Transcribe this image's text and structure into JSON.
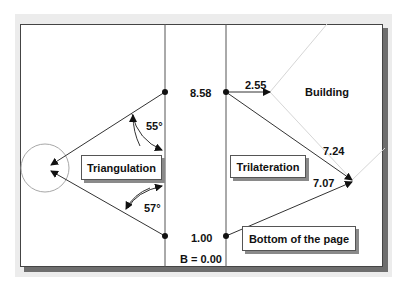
{
  "diagram": {
    "left_section": {
      "box_label": "Triangulation",
      "angle_top": "55°",
      "angle_bottom": "57°"
    },
    "right_section": {
      "box_label": "Trilateration",
      "building_label": "Building",
      "distance_top_horizontal": "2.55",
      "distance_diagonal_top": "7.24",
      "distance_diagonal_bottom": "7.07",
      "bottom_box_label": "Bottom of the page"
    },
    "middle_column": {
      "top_value": "8.58",
      "bottom_value": "1.00",
      "baseline_label": "B = 0.00"
    },
    "colors": {
      "line": "#333333",
      "light_line": "#d0d0d0",
      "circle": "#a0a0a0",
      "frame_shadow": "#6e6e6e",
      "panel": "#ececec"
    }
  }
}
